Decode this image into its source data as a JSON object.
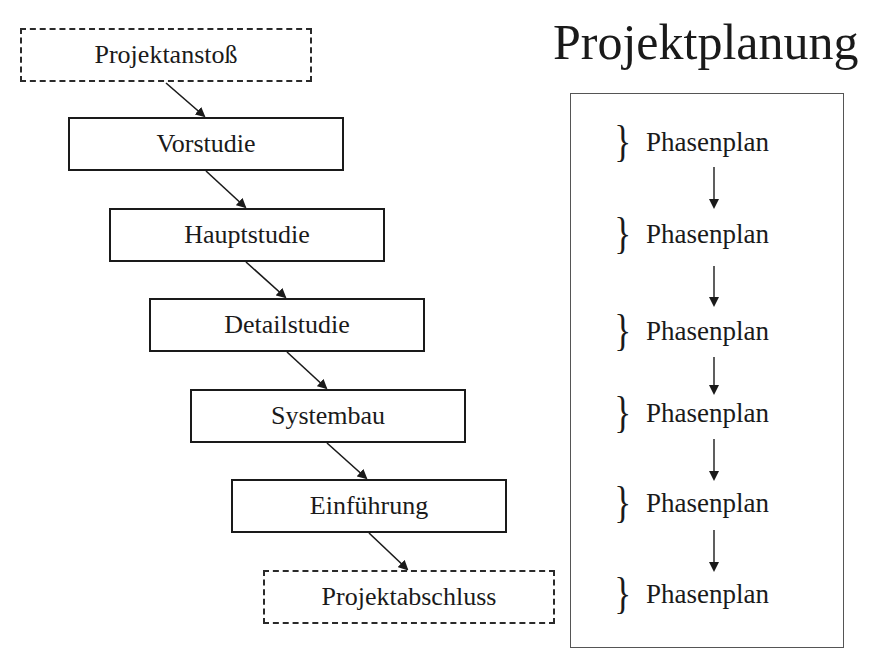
{
  "title": "Projektplanung",
  "flow": {
    "start": "Projektanstoß",
    "phases": [
      "Vorstudie",
      "Hauptstudie",
      "Detailstudie",
      "Systembau",
      "Einführung"
    ],
    "end": "Projektabschluss"
  },
  "planning_panel": {
    "items": [
      "Phasenplan",
      "Phasenplan",
      "Phasenplan",
      "Phasenplan",
      "Phasenplan",
      "Phasenplan"
    ],
    "brace_icon": "}"
  },
  "colors": {
    "line": "#1a1a1a",
    "background": "#ffffff"
  }
}
